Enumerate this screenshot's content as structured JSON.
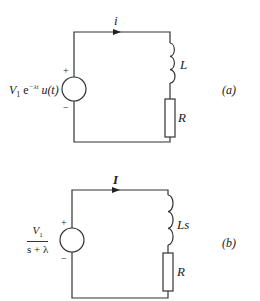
{
  "figure": {
    "circuit_a": {
      "tag": "(a)",
      "source_label_prefix": "V",
      "source_label_sub": "1",
      "source_label_exp_base": " e",
      "source_label_exp": "−λt",
      "source_label_suffix": " u(t)",
      "plus": "+",
      "minus": "−",
      "current_label": "i",
      "inductor_label": "L",
      "resistor_label": "R"
    },
    "circuit_b": {
      "tag": "(b)",
      "source_num_prefix": "V",
      "source_num_sub": "1",
      "source_den": "s + λ",
      "plus": "+",
      "minus": "−",
      "current_label": "I",
      "inductor_label": "Ls",
      "resistor_label": "R"
    }
  }
}
